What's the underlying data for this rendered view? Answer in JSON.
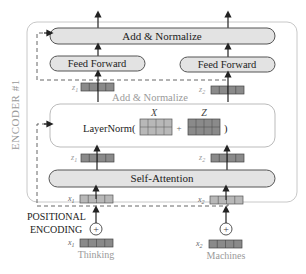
{
  "diagram": {
    "encoder_label": "ENCODER #1",
    "top_add_normalize": "Add & Normalize",
    "feed_forward_1": "Feed Forward",
    "feed_forward_2": "Feed Forward",
    "mid_add_normalize": "Add & Normalize",
    "layernorm_prefix": "LayerNorm(",
    "layernorm_plus": "+",
    "layernorm_suffix": ")",
    "matrix_x_label": "X",
    "matrix_z_label": "Z",
    "self_attention": "Self-Attention",
    "z1_label_upper": "z",
    "z1_sub_upper": "1",
    "z2_label_upper": "z",
    "z2_sub_upper": "2",
    "z1_label_lower": "z",
    "z1_sub_lower": "1",
    "z2_label_lower": "z",
    "z2_sub_lower": "2",
    "x1_label_inner": "x",
    "x1_sub_inner": "1",
    "x2_label_inner": "x",
    "x2_sub_inner": "2",
    "positional_encoding_line1": "POSITIONAL",
    "positional_encoding_line2": "ENCODING",
    "plus_symbol": "+",
    "x1_label_input": "x",
    "x1_sub_input": "1",
    "x2_label_input": "x",
    "x2_sub_input": "2",
    "word_1": "Thinking",
    "word_2": "Machines"
  },
  "colors": {
    "oval_fill": "#e3e3e3",
    "oval_stroke": "#555555",
    "vector_fill": "#8a8a8a",
    "vector_light_fill": "#b8b8b8",
    "frame_stroke": "#c8c8c8",
    "faded_text": "#9a9a9a"
  }
}
